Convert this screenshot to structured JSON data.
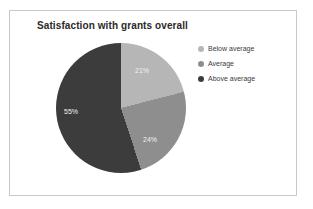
{
  "chart_data": {
    "type": "pie",
    "title": "Satisfaction with grants overall",
    "xlabel": "",
    "ylabel": "",
    "legend_position": "right",
    "grid": false,
    "start_angle_deg": 0,
    "direction": "clockwise",
    "categories": [
      "Below average",
      "Average",
      "Above average"
    ],
    "values": [
      21,
      24,
      55
    ],
    "value_unit": "%",
    "data_labels": [
      "21%",
      "24%",
      "55%"
    ],
    "colors": [
      "#b6b6b6",
      "#8e8e8e",
      "#3c3c3c"
    ],
    "slices": [
      {
        "label": "Below average",
        "value": 21,
        "data_label": "21%",
        "color": "#b6b6b6"
      },
      {
        "label": "Average",
        "value": 24,
        "data_label": "24%",
        "color": "#8e8e8e"
      },
      {
        "label": "Above average",
        "value": 55,
        "data_label": "55%",
        "color": "#3c3c3c"
      }
    ]
  },
  "figure": {
    "title": "Satisfaction with grants overall",
    "border_color": "#c9c9c9",
    "background": "#ffffff"
  },
  "legend": {
    "items": [
      {
        "label": "Below average",
        "color": "#b6b6b6"
      },
      {
        "label": "Average",
        "color": "#8e8e8e"
      },
      {
        "label": "Above average",
        "color": "#3c3c3c"
      }
    ]
  }
}
